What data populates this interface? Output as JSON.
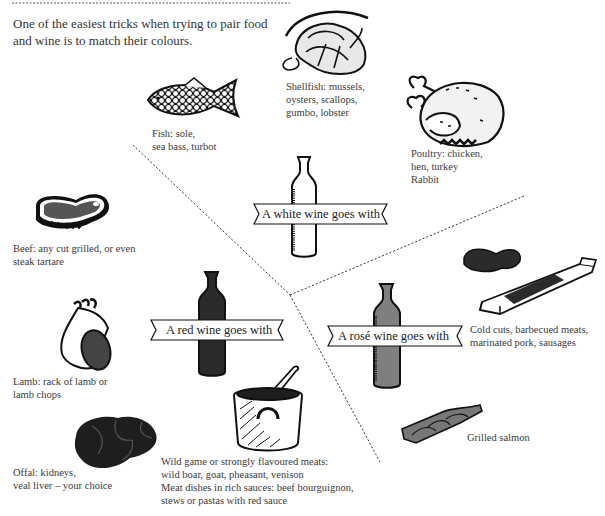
{
  "intro": {
    "line1": "One of the easiest tricks when trying to pair food",
    "line2": "and wine is to match their colours."
  },
  "wines": {
    "white": {
      "label": "A white wine goes with",
      "color": "#ffffff"
    },
    "red": {
      "label": "A red wine goes with",
      "color": "#2b2b2b"
    },
    "rose": {
      "label": "A rosé wine goes with",
      "color": "#7f7f7f"
    }
  },
  "foods": {
    "shellfish": {
      "icon": "shellfish-icon",
      "lines": [
        "Shellfish: mussels,",
        "oysters, scallops,",
        "gumbo, lobster"
      ]
    },
    "fish": {
      "icon": "fish-icon",
      "lines": [
        "Fish: sole,",
        "sea bass, turbot"
      ]
    },
    "poultry": {
      "icon": "roast-chicken-icon",
      "lines": [
        "Poultry: chicken,",
        "hen, turkey",
        "Rabbit"
      ]
    },
    "beef": {
      "icon": "steak-icon",
      "lines": [
        "Beef: any cut grilled, or even",
        "steak tartare"
      ]
    },
    "lamb": {
      "icon": "lamb-rack-icon",
      "lines": [
        "Lamb: rack of lamb or",
        "lamb chops"
      ]
    },
    "offal": {
      "icon": "offal-icon",
      "lines": [
        "Offal: kidneys,",
        "veal liver – your choice"
      ]
    },
    "game": {
      "icon": "stew-pot-icon",
      "lines": [
        "Wild game or strongly flavoured meats:",
        "wild boar, goat, pheasant, venison",
        "Meat dishes in rich sauces: beef bourguignon,",
        "stews or pastas with red sauce"
      ]
    },
    "coldcuts": {
      "icon": "sausage-board-icon",
      "lines": [
        "Cold cuts, barbecued meats,",
        "marinated pork, sausages"
      ]
    },
    "salmon": {
      "icon": "grilled-salmon-icon",
      "lines": [
        "Grilled salmon"
      ]
    }
  }
}
